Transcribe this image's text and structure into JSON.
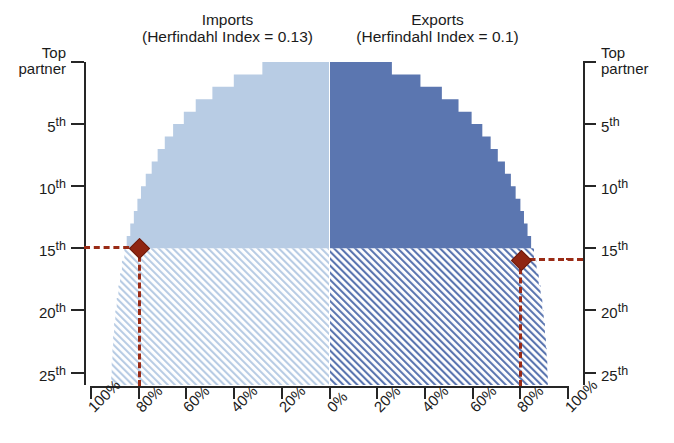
{
  "caption_sliver": " ",
  "panels": {
    "left": {
      "title": "Imports",
      "subtitle": "(Herfindahl Index = 0.13)",
      "fill_color": "#b8cce4",
      "hatch_color": "#c6d8ea"
    },
    "right": {
      "title": "Exports",
      "subtitle": "(Herfindahl Index = 0.1)",
      "fill_color": "#5b76b0",
      "hatch_color": "#5b76b0"
    }
  },
  "axes": {
    "y_left_labels": [
      {
        "text": "Top",
        "text2": "partner",
        "rank": 0
      },
      {
        "text": "5",
        "sup": "th",
        "rank": 5
      },
      {
        "text": "10",
        "sup": "th",
        "rank": 10
      },
      {
        "text": "15",
        "sup": "th",
        "rank": 15
      },
      {
        "text": "20",
        "sup": "th",
        "rank": 20
      },
      {
        "text": "25",
        "sup": "th",
        "rank": 25
      }
    ],
    "y_right_labels": [
      {
        "text": "Top",
        "text2": "partner",
        "rank": 0
      },
      {
        "text": "5",
        "sup": "th",
        "rank": 5
      },
      {
        "text": "10",
        "sup": "th",
        "rank": 10
      },
      {
        "text": "15",
        "sup": "th",
        "rank": 15
      },
      {
        "text": "20",
        "sup": "th",
        "rank": 20
      },
      {
        "text": "25",
        "sup": "th",
        "rank": 25
      }
    ],
    "x_left_labels": [
      "100%",
      "80%",
      "60%",
      "40%",
      "20%",
      "0%"
    ],
    "x_right_labels": [
      "20%",
      "40%",
      "60%",
      "80%",
      "100%"
    ],
    "axis_color": "#262626"
  },
  "markers": {
    "color": "#9a2b16",
    "left": {
      "rank_label": "15th",
      "percent_label": "80%"
    },
    "right": {
      "rank_label": "15th",
      "percent_label": "80%"
    }
  },
  "chart_data": {
    "type": "area",
    "xlabel": "Cumulative share of trade (%)",
    "ylabel": "Partner rank",
    "grid": false,
    "legend": "none",
    "xlim": [
      -100,
      100
    ],
    "ylim": [
      0,
      26
    ],
    "series": [
      {
        "name": "Imports",
        "herfindahl_index": 0.13,
        "side": "left",
        "color": "#b8cce4",
        "hatched_below_rank": 15,
        "ranks": [
          1,
          2,
          3,
          4,
          5,
          6,
          7,
          8,
          9,
          10,
          11,
          12,
          13,
          14,
          15,
          16,
          17,
          18,
          19,
          20,
          21,
          22,
          23,
          24,
          25,
          26
        ],
        "cumulative_percent": [
          28,
          40,
          49,
          56,
          61,
          65.5,
          69,
          72,
          74.5,
          77,
          79,
          80.5,
          82,
          83.5,
          85,
          86,
          87,
          87.8,
          88.5,
          89.2,
          89.8,
          90.3,
          90.7,
          91,
          91.3,
          91.5
        ]
      },
      {
        "name": "Exports",
        "herfindahl_index": 0.1,
        "side": "right",
        "color": "#5b76b0",
        "hatched_below_rank": 15,
        "ranks": [
          1,
          2,
          3,
          4,
          5,
          6,
          7,
          8,
          9,
          10,
          11,
          12,
          13,
          14,
          15,
          16,
          17,
          18,
          19,
          20,
          21,
          22,
          23,
          24,
          25,
          26
        ],
        "cumulative_percent": [
          26,
          38,
          47,
          54,
          59.5,
          64,
          67.5,
          70.5,
          73.5,
          76,
          78,
          80,
          81.5,
          83,
          84.5,
          85.7,
          86.8,
          87.7,
          88.5,
          89.2,
          89.8,
          90.3,
          90.7,
          91,
          91.3,
          91.5
        ]
      }
    ],
    "annotations": [
      {
        "label": "Imports: top 15 partners ≈ 80%",
        "x": -80,
        "y": 15,
        "marker": "diamond",
        "color": "#9a2b16"
      },
      {
        "label": "Exports: top 15 partners ≈ 80%",
        "x": 80,
        "y": 15,
        "marker": "diamond",
        "color": "#9a2b16"
      }
    ]
  }
}
